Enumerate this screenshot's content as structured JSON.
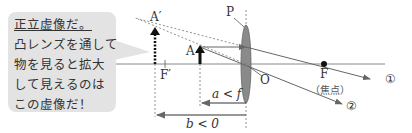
{
  "bubble": {
    "lines": [
      "正立虚像だ。",
      "凸レンズを通して",
      "物を見ると拡大",
      "して見えるのは",
      "この虚像だ！"
    ]
  },
  "labels": {
    "virtual_image": "A′",
    "object": "A",
    "lens_top": "P",
    "lens_center": "O",
    "focus_near": "F′",
    "focus_far": "F",
    "focus_note": "（焦点）",
    "ray1": "①",
    "ray2": "②",
    "a_condition": "a < f",
    "b_condition": "b < 0"
  },
  "colors": {
    "bubble_bg": "#e3e3e3",
    "lens_fill": "#8a8a8a",
    "lines": "#555555",
    "text": "#333333"
  }
}
